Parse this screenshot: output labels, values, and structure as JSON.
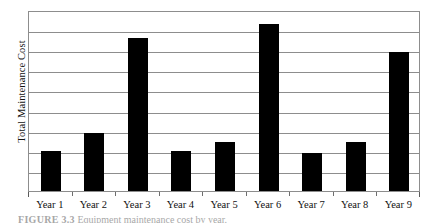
{
  "figure": {
    "caption_label": "FIGURE 3.3",
    "caption_text": "Equipment maintenance cost by year."
  },
  "axes": {
    "y_title": "Total Maintenance Cost",
    "x_title": ""
  },
  "chart_data": {
    "type": "bar",
    "title": "",
    "subtitle": "",
    "xlabel": "",
    "ylabel": "Total Maintenance Cost",
    "categories": [
      "Year 1",
      "Year 2",
      "Year 3",
      "Year 4",
      "Year 5",
      "Year 6",
      "Year 7",
      "Year 8",
      "Year 9"
    ],
    "values": [
      2.0,
      2.9,
      7.6,
      2.0,
      2.45,
      8.3,
      1.9,
      2.45,
      6.9
    ],
    "ylim": [
      0,
      9
    ],
    "y_tick_labels": [],
    "y_gridline_count": 8,
    "grid": true,
    "legend": null,
    "legend_position": "none",
    "bar_color": "#000000",
    "frame_color": "#8d8d8d",
    "background_color": "#ffffff",
    "annotations": []
  }
}
